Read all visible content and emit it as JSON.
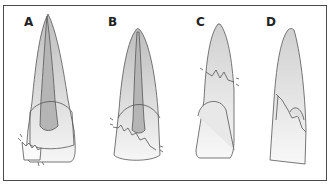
{
  "figure": {
    "panels": [
      {
        "id": "A",
        "label": "A",
        "description": "Crown-root fracture at cervical margin, lingual fragment"
      },
      {
        "id": "B",
        "label": "B",
        "description": "Oblique fracture through crown and pulp chamber"
      },
      {
        "id": "C",
        "label": "C",
        "description": "Horizontal root fracture"
      },
      {
        "id": "D",
        "label": "D",
        "description": "Oblique crown-root fracture"
      }
    ],
    "colors": {
      "outline": "#555555",
      "pulp": "#b8b8b8",
      "root_fill_top": "#c8c8c8",
      "root_fill_bottom": "#f4f4f4",
      "border": "#4a4a4a"
    }
  }
}
